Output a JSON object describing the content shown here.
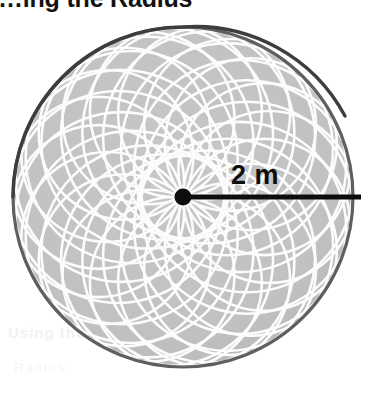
{
  "heading": {
    "text": "…ing the Radius",
    "cropped": true
  },
  "ghost": {
    "line1": "Using the",
    "line2": "Radius"
  },
  "figure": {
    "name": "circle-with-radius",
    "center_dot_label": "center-point",
    "radius_label": "2 m",
    "colors": {
      "disc_fill": "#c0c0c0",
      "disc_outline": "#5a5a5a",
      "pattern_stroke": "#ffffff",
      "radius_line": "#0d0d0d",
      "center_dot": "#0d0d0d",
      "background": "#ffffff",
      "heading_text": "#121212"
    },
    "geometry": {
      "center_x": 183,
      "center_y": 197,
      "disc_radius": 171,
      "dot_radius": 8,
      "radius_line_end_x": 361,
      "petal_count": 19,
      "petal_circle_radius": 86
    }
  },
  "chart_data": {
    "type": "diagram",
    "title": "…ing the Radius",
    "shape": "circle",
    "annotations": [
      {
        "label": "2 m",
        "measures": "radius",
        "value": 2,
        "unit": "m"
      }
    ],
    "decoration": "spirograph rose pattern of 19 overlapping circles through center"
  }
}
